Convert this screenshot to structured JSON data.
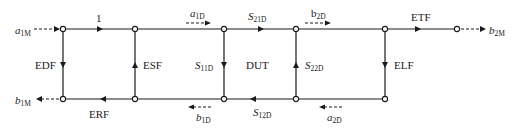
{
  "diagram": {
    "type": "signal-flow-graph",
    "title": "",
    "left_port": {
      "incident": {
        "base": "a",
        "sub": "1M"
      },
      "reflected": {
        "base": "b",
        "sub": "1M"
      }
    },
    "right_port": {
      "transmitted": {
        "base": "b",
        "sub": "2M"
      }
    },
    "error_terms": {
      "directivity": "EDF",
      "source_match": "ESF",
      "reflection_tracking": "ERF",
      "top_unity": "1",
      "transmission_tracking": "ETF",
      "load_match": "ELF"
    },
    "dut": {
      "label": "DUT",
      "s11": {
        "base": "S",
        "sub": "11D"
      },
      "s21": {
        "base": "S",
        "sub": "21D"
      },
      "s12": {
        "base": "S",
        "sub": "12D"
      },
      "s22": {
        "base": "S",
        "sub": "22D"
      },
      "a1": {
        "base": "a",
        "sub": "1D"
      },
      "b1": {
        "base": "b",
        "sub": "1D"
      },
      "a2": {
        "base": "a",
        "sub": "2D"
      },
      "b2": {
        "base": "b",
        "sub": "2D"
      }
    },
    "colors": {
      "line": "#1a1a1a",
      "background": "#ffffff"
    }
  }
}
